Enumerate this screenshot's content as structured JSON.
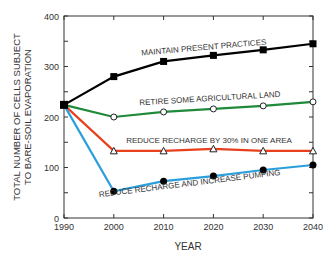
{
  "chart_data": {
    "type": "line",
    "title": "",
    "xlabel": "YEAR",
    "ylabel": "TOTAL NUMBER OF CELLS SUBJECT TO BARE-SOIL EVAPORATION",
    "ylabel_lines": [
      "TOTAL NUMBER OF CELLS SUBJECT",
      "TO BARE-SOIL EVAPORATION"
    ],
    "x": [
      1990,
      2000,
      2010,
      2020,
      2030,
      2040
    ],
    "xlim": [
      1990,
      2040
    ],
    "ylim": [
      0,
      400
    ],
    "xticks": [
      "1990",
      "2000",
      "2010",
      "2020",
      "2030",
      "2040"
    ],
    "yticks": [
      "0",
      "100",
      "200",
      "300",
      "400"
    ],
    "grid": false,
    "legend_position": "inline labels",
    "series": [
      {
        "name": "MAINTAIN PRESENT PRACTICES",
        "color": "#000000",
        "marker": "filled-square",
        "values": [
          224,
          280,
          310,
          322,
          333,
          345
        ]
      },
      {
        "name": "RETIRE SOME AGRICULTURAL LAND",
        "color": "#1e8a3a",
        "marker": "open-circle",
        "values": [
          224,
          200,
          210,
          216,
          222,
          230
        ]
      },
      {
        "name": "REDUCE RECHARGE BY 30% IN ONE AREA",
        "color": "#e8401c",
        "marker": "open-triangle",
        "values": [
          224,
          133,
          133,
          137,
          133,
          133
        ]
      },
      {
        "name": "REDUCE RECHARGE  AND INCREASE PUMPING",
        "color": "#2a9fdc",
        "marker": "filled-circle",
        "values": [
          224,
          53,
          73,
          83,
          95,
          105
        ]
      }
    ]
  }
}
